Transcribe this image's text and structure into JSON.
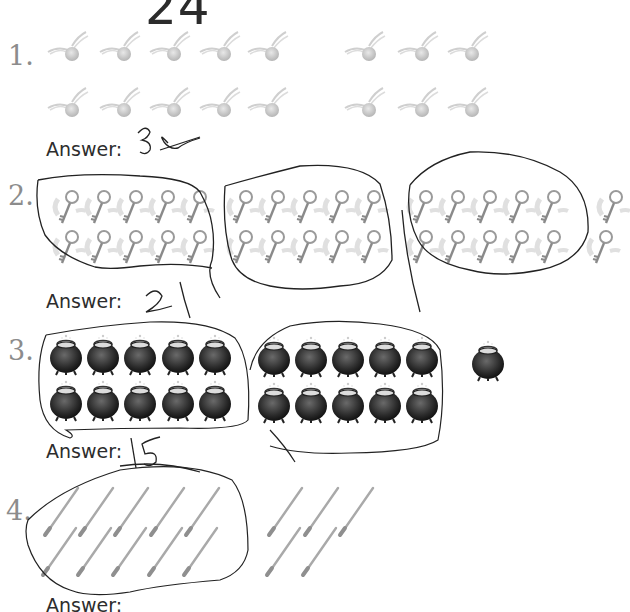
{
  "page": {
    "title": "24"
  },
  "questions": [
    {
      "number": "1.",
      "object": "golden-snitch",
      "count": 16,
      "rows": [
        [
          50,
          100,
          150,
          200,
          250,
          345,
          395,
          445
        ],
        [
          50,
          100,
          150,
          200,
          250,
          345,
          395,
          445
        ]
      ],
      "answer_label": "Answer:",
      "handwritten_answer": "30"
    },
    {
      "number": "2.",
      "object": "winged-key",
      "count": 32,
      "answer_label": "Answer:",
      "handwritten_answer": "21"
    },
    {
      "number": "3.",
      "object": "cauldron",
      "count": 21,
      "answer_label": "Answer:",
      "handwritten_answer": "15"
    },
    {
      "number": "4.",
      "object": "wand",
      "count": 18,
      "answer_label": "Answer:",
      "handwritten_answer": ""
    }
  ]
}
